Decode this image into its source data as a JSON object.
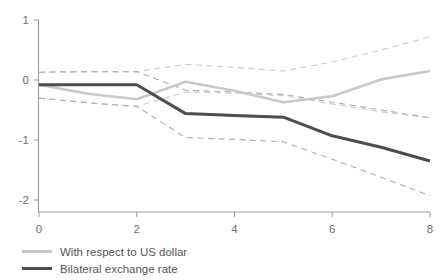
{
  "chart_data": {
    "type": "line",
    "title": "",
    "subtitle": "",
    "xlabel": "",
    "ylabel": "",
    "xlim": [
      0,
      8
    ],
    "ylim": [
      -2,
      1
    ],
    "grid": false,
    "legend_position": "bottom-left",
    "x_ticks": [
      "0",
      "2",
      "4",
      "6",
      "8"
    ],
    "x_tick_values": [
      0,
      2,
      4,
      6,
      8
    ],
    "y_ticks": [
      "1",
      "0",
      "-1",
      "-2"
    ],
    "y_tick_values": [
      1,
      0,
      -1,
      -2
    ],
    "x": [
      0,
      1,
      2,
      3,
      4,
      5,
      6,
      7,
      8
    ],
    "series": [
      {
        "name": "With respect to US dollar",
        "color": "#c8c8c8",
        "style": "solid",
        "values": [
          -0.08,
          -0.23,
          -0.32,
          -0.03,
          -0.18,
          -0.37,
          -0.27,
          0.01,
          0.15
        ]
      },
      {
        "name": "Bilateral exchange rate",
        "color": "#4d4d4d",
        "style": "solid",
        "values": [
          -0.08,
          -0.08,
          -0.08,
          -0.56,
          -0.59,
          -0.62,
          -0.93,
          -1.12,
          -1.35
        ]
      }
    ],
    "bands": [
      {
        "name": "With respect to US dollar upper",
        "of_series": "With respect to US dollar",
        "color": "#cccccc",
        "style": "dashed",
        "values": [
          0.13,
          0.14,
          0.14,
          0.26,
          0.21,
          0.15,
          0.3,
          0.5,
          0.72
        ]
      },
      {
        "name": "With respect to US dollar lower",
        "of_series": "With respect to US dollar",
        "color": "#cccccc",
        "style": "dashed",
        "values": [
          -0.3,
          -0.38,
          -0.44,
          -0.2,
          -0.22,
          -0.26,
          -0.4,
          -0.53,
          -0.63
        ]
      },
      {
        "name": "Bilateral exchange rate upper",
        "of_series": "Bilateral exchange rate",
        "color": "#b0b0b0",
        "style": "dashed",
        "values": [
          0.13,
          0.14,
          0.14,
          -0.17,
          -0.2,
          -0.24,
          -0.37,
          -0.5,
          -0.63
        ]
      },
      {
        "name": "Bilateral exchange rate lower",
        "of_series": "Bilateral exchange rate",
        "color": "#b0b0b0",
        "style": "dashed",
        "values": [
          -0.3,
          -0.38,
          -0.44,
          -0.96,
          -0.99,
          -1.03,
          -1.32,
          -1.62,
          -1.93
        ]
      }
    ],
    "legend": [
      {
        "label": "With respect to US dollar",
        "color": "#c8c8c8"
      },
      {
        "label": "Bilateral exchange rate",
        "color": "#4d4d4d"
      }
    ]
  },
  "axes": {
    "y_labels": [
      "1",
      "0",
      "-1",
      "-2"
    ],
    "x_labels": [
      "0",
      "2",
      "4",
      "6",
      "8"
    ]
  },
  "legend": {
    "items": [
      {
        "label": "With respect to US dollar"
      },
      {
        "label": "Bilateral exchange rate"
      }
    ]
  },
  "colors": {
    "usd_series": "#c8c8c8",
    "bilateral_series": "#4d4d4d",
    "band_usd": "#cccccc",
    "band_bilateral": "#b0b0b0",
    "axis": "#9a9a9a",
    "text": "#555555",
    "background": "#ffffff"
  }
}
